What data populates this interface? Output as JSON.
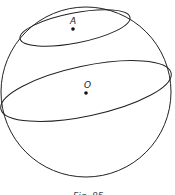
{
  "figure": {
    "caption": "Fig. 85",
    "points": [
      {
        "label": "A",
        "x": 73,
        "y": 29
      },
      {
        "label": "O",
        "x": 86,
        "y": 93
      }
    ],
    "sphere": {
      "cx": 86,
      "cy": 92,
      "r": 86
    },
    "small_circle": {
      "cx": 75,
      "cy": 28,
      "rx": 56,
      "ry": 15,
      "rotate": -11
    },
    "great_circle": {
      "cx": 86,
      "cy": 91,
      "rx": 87,
      "ry": 25,
      "rotate": -12
    },
    "stroke_color": "#222222"
  }
}
